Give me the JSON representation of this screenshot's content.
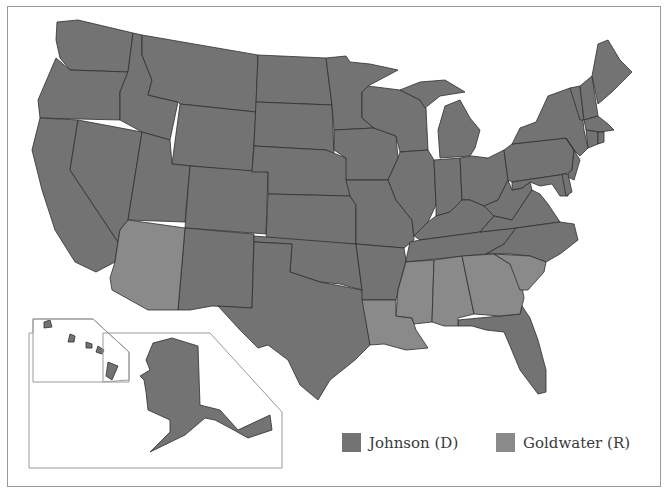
{
  "map": {
    "title": "1964 United States presidential election results",
    "colors": {
      "johnson": "#737373",
      "goldwater": "#8a8a8a",
      "border": "#2e2e2e",
      "water": "#ffffff",
      "frame": "#9a9a9a"
    },
    "goldwater_states": [
      "Arizona",
      "Louisiana",
      "Mississippi",
      "Alabama",
      "Georgia",
      "South Carolina"
    ],
    "johnson_states": [
      "Washington",
      "Oregon",
      "California",
      "Nevada",
      "Idaho",
      "Montana",
      "Wyoming",
      "Utah",
      "Colorado",
      "New Mexico",
      "North Dakota",
      "South Dakota",
      "Nebraska",
      "Kansas",
      "Oklahoma",
      "Texas",
      "Minnesota",
      "Iowa",
      "Missouri",
      "Arkansas",
      "Wisconsin",
      "Illinois",
      "Michigan",
      "Indiana",
      "Ohio",
      "Kentucky",
      "Tennessee",
      "West Virginia",
      "Virginia",
      "North Carolina",
      "Florida",
      "Pennsylvania",
      "New York",
      "New Jersey",
      "Delaware",
      "Maryland",
      "Vermont",
      "New Hampshire",
      "Maine",
      "Massachusetts",
      "Connecticut",
      "Rhode Island",
      "Alaska",
      "Hawaii"
    ],
    "insets": [
      "Alaska",
      "Hawaii"
    ]
  },
  "legend": {
    "items": [
      {
        "label": "Johnson (D)",
        "color": "#737373"
      },
      {
        "label": "Goldwater (R)",
        "color": "#8a8a8a"
      }
    ]
  }
}
